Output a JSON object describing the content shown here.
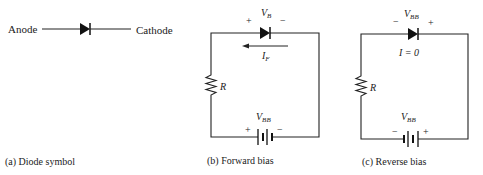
{
  "diagram": {
    "panel_a": {
      "anode_label": "Anode",
      "cathode_label": "Cathode",
      "caption": "(a) Diode symbol"
    },
    "panel_b": {
      "plus": "+",
      "minus": "−",
      "vb_main": "V",
      "vb_sub": "B",
      "current_main": "I",
      "current_sub": "F",
      "resistor_label": "R",
      "source_main": "V",
      "source_sub": "BB",
      "bat_plus": "+",
      "bat_minus": "−",
      "caption": "(b) Forward bias"
    },
    "panel_c": {
      "minus": "−",
      "plus": "+",
      "v_main": "V",
      "v_sub": "BB",
      "current_text": "I = 0",
      "resistor_label": "R",
      "source_main": "V",
      "source_sub": "BB",
      "bat_minus": "−",
      "bat_plus": "+",
      "caption": "(c) Reverse bias"
    },
    "colors": {
      "ink": "#222222",
      "background": "#ffffff"
    }
  }
}
